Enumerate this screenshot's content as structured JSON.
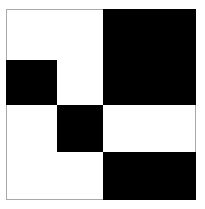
{
  "figure": {
    "title": "Abstract black and white block pattern",
    "type": "geometric-composition",
    "canvas": {
      "width": 205,
      "height": 209,
      "background_color": "#ffffff"
    },
    "frame": {
      "name": "outer-frame",
      "x": 6,
      "y": 9,
      "width": 190,
      "height": 191,
      "border_color": "#a8a8a8",
      "border_width": 1,
      "fill_color": "#ffffff"
    },
    "palette": {
      "black": "#000000",
      "white": "#ffffff",
      "frame_gray": "#a8a8a8"
    },
    "grid": {
      "vertical_divisions": [
        57,
        103
      ],
      "horizontal_divisions": [
        60,
        105,
        152
      ]
    },
    "blocks": [
      {
        "name": "top-right-black-block",
        "color": "#000000",
        "x": 103,
        "y": 9,
        "width": 93,
        "height": 96
      },
      {
        "name": "upper-left-black-square",
        "color": "#000000",
        "x": 6,
        "y": 60,
        "width": 51,
        "height": 45
      },
      {
        "name": "center-black-square",
        "color": "#000000",
        "x": 57,
        "y": 105,
        "width": 46,
        "height": 47
      },
      {
        "name": "bottom-right-black-block",
        "color": "#000000",
        "x": 103,
        "y": 152,
        "width": 93,
        "height": 48
      }
    ],
    "white_regions": [
      {
        "name": "top-left-white-region",
        "x": 6,
        "y": 9,
        "width": 97,
        "height": 51
      },
      {
        "name": "upper-middle-white-region",
        "x": 57,
        "y": 60,
        "width": 46,
        "height": 45
      },
      {
        "name": "middle-left-white-region",
        "x": 6,
        "y": 105,
        "width": 51,
        "height": 95
      },
      {
        "name": "middle-right-white-region",
        "x": 103,
        "y": 105,
        "width": 93,
        "height": 47
      },
      {
        "name": "bottom-middle-white-region",
        "x": 57,
        "y": 152,
        "width": 46,
        "height": 48
      }
    ]
  }
}
